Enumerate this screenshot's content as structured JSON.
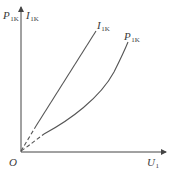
{
  "diagram": {
    "type": "characteristic-curves",
    "colors": {
      "axis": "#444444",
      "curve": "#555555",
      "label": "#3a3a3a",
      "background": "#ffffff"
    },
    "axes": {
      "origin": {
        "label": "O"
      },
      "y_axis": {
        "labels": [
          {
            "main": "P",
            "sub": "1K"
          },
          {
            "main": "I",
            "sub": "1K"
          }
        ]
      },
      "x_axis": {
        "label": {
          "main": "U",
          "sub": "1"
        }
      }
    },
    "curves": [
      {
        "name": "I1K",
        "label": {
          "main": "I",
          "sub": "1K"
        },
        "shape": "straight line through origin (steeper)",
        "solid_segment": "upper",
        "dashed_segment": "near origin"
      },
      {
        "name": "P1K",
        "label": {
          "main": "P",
          "sub": "1K"
        },
        "shape": "upward-curving (convex) curve through origin",
        "solid_segment": "upper",
        "dashed_segment": "near origin"
      }
    ]
  }
}
